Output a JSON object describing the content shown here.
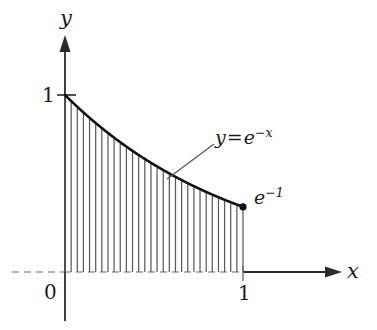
{
  "figure": {
    "kind": "math-plot",
    "background_color": "#ffffff",
    "ink_color": "#1a1a1a",
    "axis_color": "#333333",
    "hatch_color": "#555555",
    "curve_color": "#111111"
  },
  "axes": {
    "x_axis": {
      "label": "x",
      "arrow": "right",
      "ticks": [
        {
          "value": "1",
          "label": "1"
        }
      ]
    },
    "y_axis": {
      "label": "y",
      "arrow": "up",
      "ticks": [
        {
          "value": "1",
          "label": "1"
        }
      ]
    },
    "origin_label": "0"
  },
  "annotations": {
    "curve_equation": {
      "lhs": "y",
      "eq": "=",
      "base": "e",
      "exponent": "−x"
    },
    "endpoint_value": {
      "base": "e",
      "exponent": "−1"
    }
  },
  "chart_data": {
    "type": "area",
    "title": "",
    "subtitle": "",
    "xlabel": "x",
    "ylabel": "y",
    "xlim": [
      -0.1,
      1.55
    ],
    "ylim": [
      -0.3,
      1.35
    ],
    "grid": false,
    "legend": null,
    "xticks": [
      0,
      1
    ],
    "xticklabels": [
      "0",
      "1"
    ],
    "yticks": [
      1
    ],
    "yticklabels": [
      "1"
    ],
    "series": [
      {
        "name": "y = e^-x",
        "function": "exp(-x)",
        "domain": [
          0,
          1
        ],
        "x": [
          0.0,
          0.05,
          0.1,
          0.15,
          0.2,
          0.25,
          0.3,
          0.35,
          0.4,
          0.45,
          0.5,
          0.55,
          0.6,
          0.65,
          0.7,
          0.75,
          0.8,
          0.85,
          0.9,
          0.95,
          1.0
        ],
        "y": [
          1.0,
          0.9512,
          0.9048,
          0.8607,
          0.8187,
          0.7788,
          0.7408,
          0.7047,
          0.6703,
          0.6376,
          0.6065,
          0.5769,
          0.5488,
          0.522,
          0.4966,
          0.4724,
          0.4493,
          0.4274,
          0.4066,
          0.3867,
          0.3679
        ],
        "endpoint": {
          "x": 1.0,
          "y": 0.3679,
          "marker": "filled-circle"
        }
      }
    ],
    "fill": {
      "style": "vertical-hatch",
      "line_count": 30,
      "from_x": 0.0,
      "to_x": 1.0,
      "baseline_y": 0.0
    },
    "annotations": [
      {
        "text": "y = e^-x",
        "x": 0.85,
        "y": 0.82,
        "leader_to": {
          "x": 0.58,
          "y": 0.56
        }
      },
      {
        "text": "e^-1",
        "x": 1.06,
        "y": 0.46
      }
    ]
  }
}
